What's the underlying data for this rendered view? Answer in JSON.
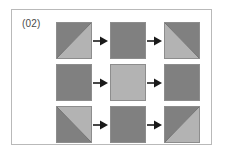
{
  "figure": {
    "label": "(02)",
    "background_color": "#ffffff",
    "frame_border_color": "#b9b9b9",
    "label_color": "#4a4a4a"
  },
  "palette": {
    "dark_gray": "#808080",
    "mid_gray": "#8a8a8a",
    "light_gray": "#b3b3b3",
    "outline": "#8d8d8d",
    "arrow": "#1a1a1a"
  },
  "diagram": {
    "type": "grid-of-shaded-squares",
    "rows": 3,
    "columns": 3,
    "arrow_glyph": "right-arrow",
    "cells": [
      [
        {
          "name": "row1-col1",
          "fill": "split-diagonal",
          "diagonal": "bottom-left-to-top-right",
          "upper_left_color": "#808080",
          "lower_right_color": "#b3b3b3"
        },
        {
          "name": "row1-col2",
          "fill": "solid",
          "color": "#808080"
        },
        {
          "name": "row1-col3",
          "fill": "split-diagonal",
          "diagonal": "top-left-to-bottom-right",
          "upper_right_color": "#808080",
          "lower_left_color": "#b3b3b3"
        }
      ],
      [
        {
          "name": "row2-col1",
          "fill": "solid",
          "color": "#808080"
        },
        {
          "name": "row2-col2",
          "fill": "solid",
          "color": "#b3b3b3"
        },
        {
          "name": "row2-col3",
          "fill": "solid",
          "color": "#808080"
        }
      ],
      [
        {
          "name": "row3-col1",
          "fill": "split-diagonal",
          "diagonal": "top-left-to-bottom-right",
          "upper_right_color": "#b3b3b3",
          "lower_left_color": "#808080"
        },
        {
          "name": "row3-col2",
          "fill": "solid",
          "color": "#808080"
        },
        {
          "name": "row3-col3",
          "fill": "split-diagonal",
          "diagonal": "bottom-left-to-top-right",
          "upper_left_color": "#808080",
          "lower_right_color": "#b3b3b3"
        }
      ]
    ],
    "arrows": [
      {
        "name": "arrow-row1-1",
        "direction": "right"
      },
      {
        "name": "arrow-row1-2",
        "direction": "right"
      },
      {
        "name": "arrow-row2-1",
        "direction": "right"
      },
      {
        "name": "arrow-row2-2",
        "direction": "right"
      },
      {
        "name": "arrow-row3-1",
        "direction": "right"
      },
      {
        "name": "arrow-row3-2",
        "direction": "right"
      }
    ]
  }
}
